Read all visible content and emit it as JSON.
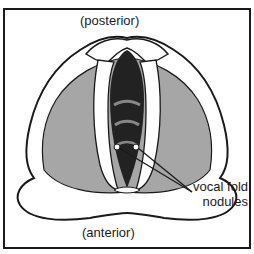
{
  "figure": {
    "labels": {
      "posterior": "(posterior)",
      "anterior": "(anterior)",
      "nodules_line1": "vocal fold",
      "nodules_line2": "nodules"
    },
    "colors": {
      "outline": "#1a1a1a",
      "tissue_gray": "#a6a6a6",
      "cartilage": "#ffffff",
      "airway": "#222222"
    }
  }
}
